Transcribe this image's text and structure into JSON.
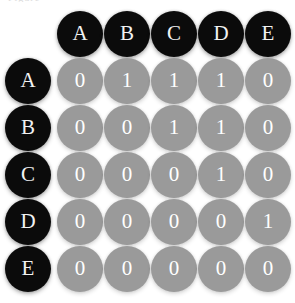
{
  "figure": {
    "caption_fragment": "Figure",
    "node_labels": [
      "A",
      "B",
      "C",
      "D",
      "E"
    ],
    "colors": {
      "label_node_fill": "#0b0b0b",
      "label_node_text": "#f2f2f2",
      "cell_node_fill": "#9a9a9a",
      "cell_node_text": "#ffffff",
      "background": "#ffffff"
    }
  },
  "chart_data": {
    "type": "heatmap",
    "title": "",
    "subtitle": "",
    "xlabel": "",
    "ylabel": "",
    "legend": [],
    "grid": false,
    "categories": [
      "A",
      "B",
      "C",
      "D",
      "E"
    ],
    "column_headers": [
      "A",
      "B",
      "C",
      "D",
      "E"
    ],
    "row_headers": [
      "A",
      "B",
      "C",
      "D",
      "E"
    ],
    "rows": [
      {
        "label": "A",
        "values": [
          0,
          1,
          1,
          1,
          0
        ]
      },
      {
        "label": "B",
        "values": [
          0,
          0,
          1,
          1,
          0
        ]
      },
      {
        "label": "C",
        "values": [
          0,
          0,
          0,
          1,
          0
        ]
      },
      {
        "label": "D",
        "values": [
          0,
          0,
          0,
          0,
          1
        ]
      },
      {
        "label": "E",
        "values": [
          0,
          0,
          0,
          0,
          0
        ]
      }
    ],
    "matrix": [
      [
        0,
        1,
        1,
        1,
        0
      ],
      [
        0,
        0,
        1,
        1,
        0
      ],
      [
        0,
        0,
        0,
        1,
        0
      ],
      [
        0,
        0,
        0,
        0,
        1
      ],
      [
        0,
        0,
        0,
        0,
        0
      ]
    ],
    "value_range": [
      0,
      1
    ]
  },
  "layout": {
    "cell_size": 47,
    "node_diameter": 46,
    "origin_x": 5,
    "origin_y": 11,
    "grid_origin_x": 57,
    "grid_origin_y": 58
  }
}
